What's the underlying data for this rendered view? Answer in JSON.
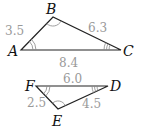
{
  "triangles": [
    {
      "name": "ABC",
      "vertices": {
        "A": {
          "label": "A",
          "angle_marks": 2
        },
        "B": {
          "label": "B",
          "angle_marks": 1
        },
        "C": {
          "label": "C",
          "angle_marks": 3
        }
      },
      "sides": {
        "AB": "3.5",
        "BC": "6.3",
        "AC": "8.4"
      }
    },
    {
      "name": "FED",
      "vertices": {
        "F": {
          "label": "F",
          "angle_marks": 2
        },
        "E": {
          "label": "E",
          "angle_marks": 1
        },
        "D": {
          "label": "D",
          "angle_marks": 3
        }
      },
      "sides": {
        "FD": "6.0",
        "FE": "2.5",
        "ED": "4.5"
      }
    }
  ],
  "colors": {
    "edge": "#222222",
    "side_label": "#999999",
    "vertex_label": "#111111"
  }
}
